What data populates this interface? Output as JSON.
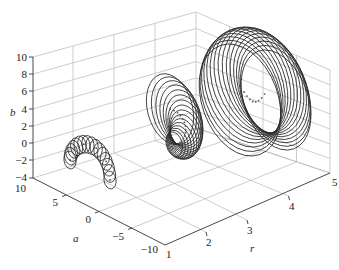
{
  "chart_data": {
    "type": "3d-line",
    "title": "",
    "xlabel": "r",
    "ylabel": "a",
    "zlabel": "b",
    "x_ticks": [
      1,
      2,
      3,
      4,
      5
    ],
    "y_ticks": [
      -10,
      -5,
      0,
      5,
      10
    ],
    "z_ticks": [
      -4,
      -2,
      0,
      2,
      4,
      6,
      8,
      10
    ],
    "xlim": [
      1,
      5
    ],
    "ylim": [
      -10,
      10
    ],
    "zlim": [
      -4,
      10
    ],
    "grid": true,
    "legend": null,
    "series": [
      {
        "name": "family r=1",
        "r": 1,
        "n_circles": 16,
        "description": "small circles arranged in an arch (horseshoe) shape, centers marked with dots",
        "a_range": [
          -6,
          6
        ],
        "b_range": [
          -3,
          2
        ]
      },
      {
        "name": "family r=3",
        "r": 3,
        "n_circles": 16,
        "description": "circles of increasing size converging at a common point, centers marked along an arc",
        "a_range": [
          -4,
          4
        ],
        "b_range": [
          -3,
          6
        ]
      },
      {
        "name": "family r=5",
        "r": 5,
        "n_circles": 16,
        "description": "large nested circles forming a torus-like ring, centers marked along an arc",
        "a_range": [
          -8,
          8
        ],
        "b_range": [
          -2,
          10
        ]
      }
    ]
  },
  "labels": {
    "r": "r",
    "a": "a",
    "b": "b"
  },
  "ticks": {
    "b": [
      "10",
      "8",
      "6",
      "4",
      "2",
      "0",
      "−2",
      "−4"
    ],
    "a": [
      "10",
      "5",
      "0",
      "−5",
      "−10"
    ],
    "r": [
      "1",
      "2",
      "3",
      "4",
      "5"
    ]
  }
}
